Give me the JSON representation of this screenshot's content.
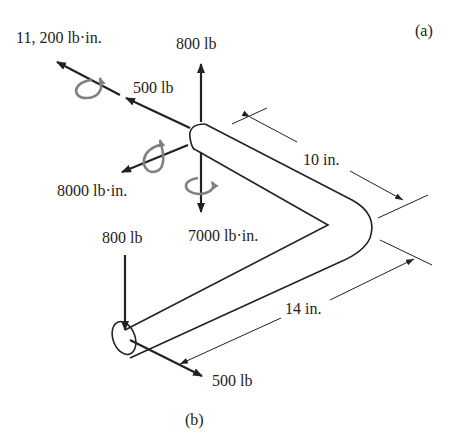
{
  "figure": {
    "panel_a_label": "(a)",
    "panel_b_label": "(b)"
  },
  "loads": {
    "moment_x": "11, 200 lb·in.",
    "force_x": "500 lb",
    "force_up": "800 lb",
    "moment_z": "8000 lb·in.",
    "moment_y": "7000 lb·in.",
    "end_force_down": "800 lb",
    "end_force_z": "500 lb"
  },
  "dimensions": {
    "segment_1": "10 in.",
    "segment_2": "14 in."
  },
  "colors": {
    "line": "#222222",
    "moment_arrow": "#808080"
  }
}
